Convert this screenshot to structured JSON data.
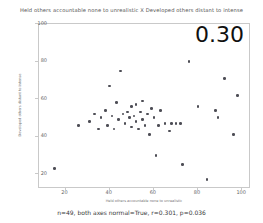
{
  "figure": {
    "suptitle": "Held others accountable none to unrealistic X Developed others distant to intense",
    "caption": "n=49, both axes normal=True, r=0.301, p=0.036",
    "corner_annotation": "0.30",
    "point_color": "#4d4d55",
    "frame_color": "#c9c9c9",
    "background": "#ffffff"
  },
  "chart_data": {
    "type": "scatter",
    "title": "Held others accountable none to unrealistic X Developed others distant to intense",
    "xlabel": "Held others accountable none to unrealistic",
    "ylabel": "Developed others distant to intense",
    "xlim": [
      8,
      104
    ],
    "ylim": [
      12,
      100
    ],
    "xticks": [
      20,
      40,
      60,
      80,
      100
    ],
    "yticks": [
      20,
      40,
      60,
      80,
      100
    ],
    "grid": false,
    "legend": null,
    "annotations": [
      {
        "text": "0.30",
        "position": "top-right",
        "meaning": "correlation coefficient"
      }
    ],
    "stats": {
      "n": 49,
      "both_axes_normal": "True",
      "r": 0.301,
      "p": 0.036
    },
    "points": [
      {
        "x": 15,
        "y": 23
      },
      {
        "x": 26,
        "y": 46
      },
      {
        "x": 31,
        "y": 48
      },
      {
        "x": 33,
        "y": 52
      },
      {
        "x": 35,
        "y": 44
      },
      {
        "x": 36,
        "y": 50
      },
      {
        "x": 38,
        "y": 54
      },
      {
        "x": 39,
        "y": 46
      },
      {
        "x": 40,
        "y": 67
      },
      {
        "x": 41,
        "y": 51
      },
      {
        "x": 42,
        "y": 44
      },
      {
        "x": 43,
        "y": 58
      },
      {
        "x": 44,
        "y": 49
      },
      {
        "x": 45,
        "y": 75
      },
      {
        "x": 46,
        "y": 52
      },
      {
        "x": 47,
        "y": 47
      },
      {
        "x": 48,
        "y": 53
      },
      {
        "x": 49,
        "y": 50
      },
      {
        "x": 50,
        "y": 56
      },
      {
        "x": 50,
        "y": 45
      },
      {
        "x": 51,
        "y": 51
      },
      {
        "x": 52,
        "y": 48
      },
      {
        "x": 52,
        "y": 57
      },
      {
        "x": 53,
        "y": 44
      },
      {
        "x": 54,
        "y": 53
      },
      {
        "x": 55,
        "y": 49
      },
      {
        "x": 55,
        "y": 59
      },
      {
        "x": 56,
        "y": 46
      },
      {
        "x": 57,
        "y": 52
      },
      {
        "x": 58,
        "y": 41
      },
      {
        "x": 59,
        "y": 55
      },
      {
        "x": 60,
        "y": 50
      },
      {
        "x": 61,
        "y": 30
      },
      {
        "x": 62,
        "y": 46
      },
      {
        "x": 63,
        "y": 54
      },
      {
        "x": 65,
        "y": 47
      },
      {
        "x": 67,
        "y": 43
      },
      {
        "x": 68,
        "y": 47
      },
      {
        "x": 70,
        "y": 47
      },
      {
        "x": 72,
        "y": 47
      },
      {
        "x": 73,
        "y": 25
      },
      {
        "x": 76,
        "y": 80
      },
      {
        "x": 80,
        "y": 56
      },
      {
        "x": 84,
        "y": 17
      },
      {
        "x": 88,
        "y": 54
      },
      {
        "x": 89,
        "y": 50
      },
      {
        "x": 92,
        "y": 71
      },
      {
        "x": 96,
        "y": 41
      },
      {
        "x": 98,
        "y": 62
      }
    ]
  }
}
